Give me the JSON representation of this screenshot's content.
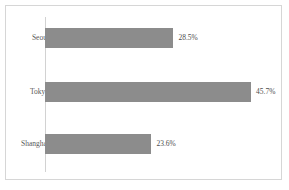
{
  "chart_data": {
    "type": "bar",
    "orientation": "horizontal",
    "title": "",
    "xlabel": "",
    "ylabel": "",
    "grid": false,
    "legend": false,
    "xlim": [
      0,
      50
    ],
    "categories": [
      "Seoul",
      "Tokyo",
      "Shanghai"
    ],
    "values": [
      28.5,
      45.7,
      23.6
    ],
    "value_labels": [
      "28.5%",
      "45.7%",
      "23.6%"
    ],
    "series": [
      {
        "name": "",
        "values": [
          28.5,
          45.7,
          23.6
        ]
      }
    ],
    "colors": {
      "bar": "#8c8c8c",
      "frame": "#d6d6d6",
      "axis_line": "#d2d2d2",
      "category_text": "#595959",
      "value_text": "#4d4d4d",
      "background": "#ffffff"
    }
  },
  "rows": [
    {
      "category": "Seoul",
      "value_label": "28.5%"
    },
    {
      "category": "Tokyo",
      "value_label": "45.7%"
    },
    {
      "category": "Shanghai",
      "value_label": "23.6%"
    }
  ]
}
